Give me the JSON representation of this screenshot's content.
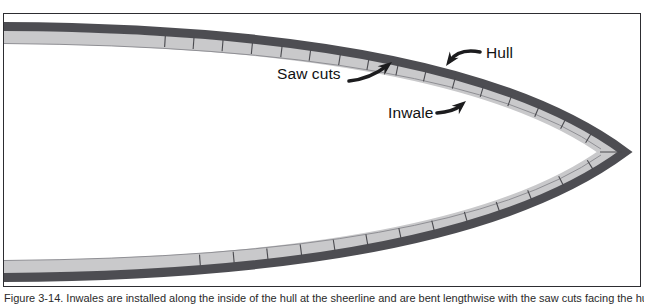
{
  "diagram": {
    "labels": {
      "saw_cuts": "Saw cuts",
      "hull": "Hull",
      "inwale": "Inwale"
    },
    "saw_cuts": {
      "top_count": 16,
      "bottom_count": 13
    },
    "caption": "Figure 3-14. Inwales are installed along the inside of the hull at the sheerline and are bent lengthwise with the saw cuts facing the hull.",
    "colors": {
      "hull_band": "#4d4d52",
      "inwale_band": "#c9c9cb",
      "inwale_edge_line": "#8f8f94",
      "tick": "#4a4a4f",
      "frame_border": "#2d2d31",
      "arrow": "#1c1c1e",
      "label_text": "#111111",
      "caption_text": "#2a2a2a",
      "background": "#ffffff"
    }
  }
}
